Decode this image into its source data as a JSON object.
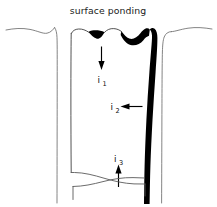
{
  "figure": {
    "caption": "surface ponding",
    "type": "hand-drawn soil infiltration schematic",
    "background_color": "#ffffff",
    "ink_color": "#000000",
    "line_color": "#5a5a5a"
  },
  "labels": {
    "flux_1": {
      "symbol": "i",
      "subscript": "1",
      "direction": "down"
    },
    "flux_2": {
      "symbol": "i",
      "subscript": "2",
      "direction": "left"
    },
    "flux_3": {
      "symbol": "i",
      "subscript": "3",
      "direction": "up"
    }
  },
  "features": {
    "surface_ponds": 2,
    "wetting_front_side": "right",
    "wetting_front_color": "#000000",
    "column_walls": 2,
    "bottom_lens": 1
  }
}
